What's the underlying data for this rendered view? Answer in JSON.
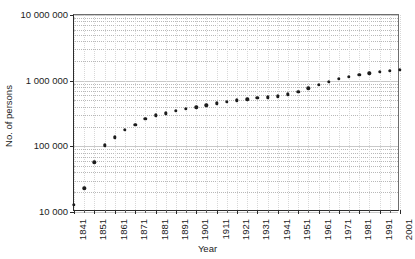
{
  "chart_data": {
    "type": "scatter",
    "title": "",
    "xlabel": "Year",
    "ylabel": "No. of persons",
    "yscale": "log",
    "ylim": [
      10000,
      10000000
    ],
    "xlim": [
      1841,
      2001
    ],
    "grid": true,
    "legend": null,
    "y_tick_labels": [
      "10 000",
      "100 000",
      "1 000 000",
      "10 000 000"
    ],
    "y_tick_values": [
      10000,
      100000,
      1000000,
      10000000
    ],
    "x_tick_labels": [
      "1841",
      "1851",
      "1861",
      "1871",
      "1881",
      "1891",
      "1901",
      "1911",
      "1921",
      "1931",
      "1941",
      "1951",
      "1961",
      "1971",
      "1981",
      "1991",
      "2001"
    ],
    "x_tick_values": [
      1841,
      1851,
      1861,
      1871,
      1881,
      1891,
      1901,
      1911,
      1921,
      1931,
      1941,
      1951,
      1961,
      1971,
      1981,
      1991,
      2001
    ],
    "x_minor_step": 5,
    "marker": "filled-circle",
    "marker_color": "#1c1c1c",
    "x": [
      1841,
      1846,
      1851,
      1856,
      1861,
      1866,
      1871,
      1876,
      1881,
      1886,
      1891,
      1896,
      1901,
      1906,
      1911,
      1916,
      1921,
      1926,
      1931,
      1936,
      1941,
      1946,
      1951,
      1956,
      1961,
      1966,
      1971,
      1976,
      1981,
      1986,
      1991,
      1996,
      2001
    ],
    "values": [
      13000,
      23000,
      57000,
      104000,
      138000,
      180000,
      215000,
      265000,
      295000,
      320000,
      345000,
      370000,
      395000,
      420000,
      450000,
      480000,
      500000,
      520000,
      545000,
      560000,
      580000,
      620000,
      680000,
      760000,
      860000,
      960000,
      1060000,
      1150000,
      1230000,
      1300000,
      1360000,
      1420000,
      1460000
    ],
    "series": [
      {
        "name": "No. of persons",
        "points": [
          {
            "x": 1841,
            "y": 13000
          },
          {
            "x": 1846,
            "y": 23000
          },
          {
            "x": 1851,
            "y": 57000
          },
          {
            "x": 1856,
            "y": 104000
          },
          {
            "x": 1861,
            "y": 138000
          },
          {
            "x": 1866,
            "y": 180000
          },
          {
            "x": 1871,
            "y": 215000
          },
          {
            "x": 1876,
            "y": 265000
          },
          {
            "x": 1881,
            "y": 295000
          },
          {
            "x": 1886,
            "y": 320000
          },
          {
            "x": 1891,
            "y": 345000
          },
          {
            "x": 1896,
            "y": 370000
          },
          {
            "x": 1901,
            "y": 395000
          },
          {
            "x": 1906,
            "y": 420000
          },
          {
            "x": 1911,
            "y": 450000
          },
          {
            "x": 1916,
            "y": 480000
          },
          {
            "x": 1921,
            "y": 500000
          },
          {
            "x": 1926,
            "y": 520000
          },
          {
            "x": 1931,
            "y": 545000
          },
          {
            "x": 1936,
            "y": 560000
          },
          {
            "x": 1941,
            "y": 580000
          },
          {
            "x": 1946,
            "y": 620000
          },
          {
            "x": 1951,
            "y": 680000
          },
          {
            "x": 1956,
            "y": 760000
          },
          {
            "x": 1961,
            "y": 860000
          },
          {
            "x": 1966,
            "y": 960000
          },
          {
            "x": 1971,
            "y": 1060000
          },
          {
            "x": 1976,
            "y": 1150000
          },
          {
            "x": 1981,
            "y": 1230000
          },
          {
            "x": 1986,
            "y": 1300000
          },
          {
            "x": 1991,
            "y": 1360000
          },
          {
            "x": 1996,
            "y": 1420000
          },
          {
            "x": 2001,
            "y": 1460000
          }
        ]
      }
    ]
  }
}
